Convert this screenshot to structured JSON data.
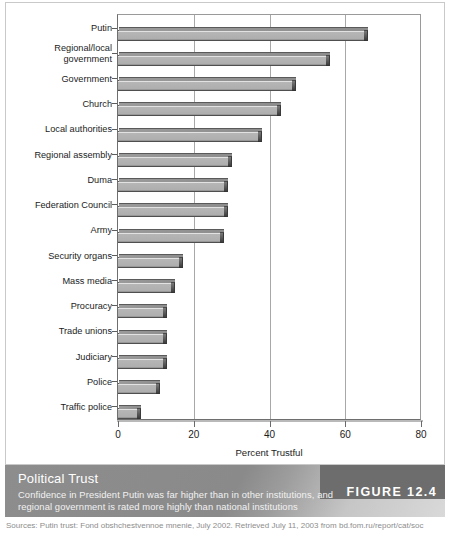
{
  "figure": {
    "badge_label": "FIGURE 12.4",
    "caption_title": "Political Trust",
    "caption_line1": "Confidence in President Putin was far higher than in other institutions, and",
    "caption_line2": "regional government is rated more highly than national institutions",
    "source": "Sources: Putin trust: Fond obshchestvennoe mnenie, July 2002. Retrieved July 11, 2003 from bd.fom.ru/report/cat/soc"
  },
  "colors": {
    "bar_fill": "#aeaeae",
    "bar_edge": "#4f4f4f",
    "bar_cap": "#3d3d3d",
    "grid": "#a8a8a8",
    "axis": "#6e6e6e",
    "caption_band": "#8d8d8d",
    "badge": "#6d6d6d",
    "text": "#1c1c1c"
  },
  "chart_data": {
    "type": "bar",
    "orientation": "horizontal",
    "title": "Political Trust",
    "xlabel": "Percent Trustful",
    "ylabel": "",
    "xlim": [
      0,
      80
    ],
    "xticks": [
      0,
      20,
      40,
      60,
      80
    ],
    "xtick_labels": [
      "0",
      "20",
      "40",
      "60",
      "80"
    ],
    "grid": "vertical gridlines at 20, 40, 60",
    "legend": "none",
    "categories": [
      "Putin",
      "Regional/local\ngovernment",
      "Government",
      "Church",
      "Local authorities",
      "Regional assembly",
      "Duma",
      "Federation Council",
      "Army",
      "Security organs",
      "Mass media",
      "Procuracy",
      "Trade unions",
      "Judiciary",
      "Police",
      "Traffic police"
    ],
    "values": [
      65,
      55,
      46,
      42,
      37,
      29,
      28,
      28,
      27,
      16,
      14,
      12,
      12,
      12,
      10,
      5
    ]
  }
}
